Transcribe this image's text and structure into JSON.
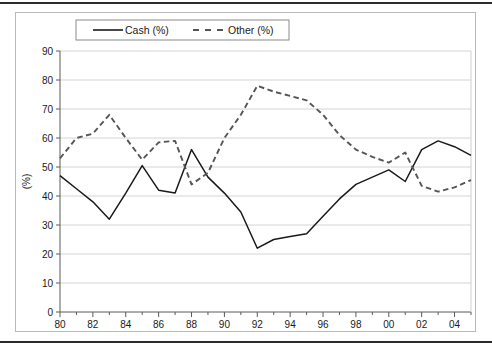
{
  "figure": {
    "background_color": "#ffffff",
    "frame_color": "#b9b9b9",
    "rule_color": "#2b2b2b"
  },
  "axis": {
    "ylabel": "(%)",
    "y_ticks": [
      "0",
      "10",
      "20",
      "30",
      "40",
      "50",
      "60",
      "70",
      "80",
      "90"
    ],
    "x_ticks": [
      "80",
      "82",
      "84",
      "86",
      "88",
      "90",
      "92",
      "94",
      "96",
      "98",
      "00",
      "02",
      "04"
    ]
  },
  "legend": {
    "items": [
      {
        "label": "Cash (%)",
        "style": "solid",
        "color": "#1a1a1a"
      },
      {
        "label": "Other (%)",
        "style": "dashed",
        "color": "#555555"
      }
    ]
  },
  "chart_data": {
    "type": "line",
    "title": "",
    "xlabel": "",
    "ylabel": "(%)",
    "xlim": [
      1980,
      2005
    ],
    "ylim": [
      0,
      90
    ],
    "grid": true,
    "legend_position": "top",
    "x": [
      1980,
      1981,
      1982,
      1983,
      1984,
      1985,
      1986,
      1987,
      1988,
      1989,
      1990,
      1991,
      1992,
      1993,
      1994,
      1995,
      1996,
      1997,
      1998,
      1999,
      2000,
      2001,
      2002,
      2003,
      2004,
      2005
    ],
    "x_tick_labels": [
      "80",
      "",
      "82",
      "",
      "84",
      "",
      "86",
      "",
      "88",
      "",
      "90",
      "",
      "92",
      "",
      "94",
      "",
      "96",
      "",
      "98",
      "",
      "00",
      "",
      "02",
      "",
      "04",
      ""
    ],
    "series": [
      {
        "name": "Cash (%)",
        "style": "solid",
        "color": "#1a1a1a",
        "values": [
          47,
          42.5,
          38,
          32,
          41,
          50.5,
          42,
          41,
          56,
          46.5,
          41,
          34.5,
          22,
          25,
          26,
          27,
          33,
          39,
          44,
          46.5,
          49,
          45,
          56,
          59,
          57,
          54
        ]
      },
      {
        "name": "Other (%)",
        "style": "dashed",
        "color": "#555555",
        "values": [
          53,
          60,
          61.5,
          68,
          60,
          52.5,
          58.5,
          59,
          44,
          48,
          60,
          68,
          78,
          76,
          74.5,
          73,
          68,
          61,
          56,
          53.5,
          51.5,
          55,
          43.5,
          41.5,
          43,
          45.5
        ]
      }
    ]
  }
}
